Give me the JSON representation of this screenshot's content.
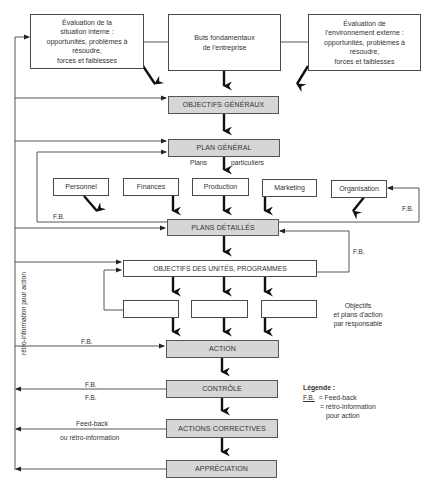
{
  "diagram": {
    "top": {
      "internal_eval": [
        "Évaluation de la",
        "situation interne :",
        "opportunités, problèmes à",
        "résoudre,",
        "forces et faiblesses"
      ],
      "fundamental_goals": [
        "Buts fondamentaux",
        "de l'entreprise"
      ],
      "external_eval": [
        "Évaluation de",
        "l'environnement externe :",
        "opportunités, problèmes à",
        "résoudre,",
        "forces et faiblesses"
      ]
    },
    "stages": {
      "objectifs_generaux": "OBJECTIFS GÉNÉRAUX",
      "plan_general": "PLAN GÉNÉRAL",
      "plans_detailles": "PLANS DÉTAILLÉS",
      "objectifs_unites": "OBJECTIFS DES UNITÉS, PROGRAMMES",
      "action": "ACTION",
      "controle": "CONTRÔLE",
      "actions_correctives": "ACTIONS CORRECTIVES",
      "appreciation": "APPRÉCIATION"
    },
    "plans_particuliers": {
      "left": "Plans",
      "right": "particuliers"
    },
    "functions": [
      "Personnel",
      "Finances",
      "Production",
      "Marketing",
      "Organisation"
    ],
    "responsible_boxes_count": 3,
    "responsible_note": [
      "Objectifs",
      "et plans d'action",
      "par responsable"
    ],
    "feedback_labels": {
      "fb": "F.B.",
      "feed_back": "Feed-back",
      "ou_retro": "ou rétro-information",
      "vertical": "rétro-information pour action"
    },
    "legend": {
      "title": "Légende :",
      "abbr": "F.B.",
      "line1": "= Feed-back",
      "line2": "= rétro-information",
      "line3": "pour action"
    }
  }
}
